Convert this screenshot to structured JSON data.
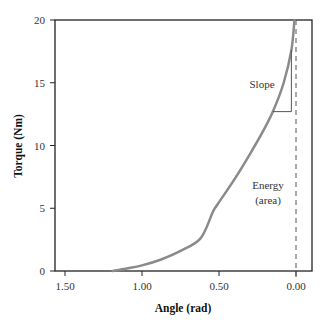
{
  "chart_data": {
    "type": "line",
    "title": "",
    "xlabel": "Angle (rad)",
    "ylabel": "Torque (Nm)",
    "xlim": [
      1.63,
      -0.1
    ],
    "ylim": [
      0,
      20
    ],
    "x_reversed": true,
    "grid": false,
    "legend": null,
    "x_ticks": [
      1.5,
      1.0,
      0.5,
      0.0
    ],
    "x_tick_labels": [
      "1.50",
      "1.00",
      "0.50",
      "0.00"
    ],
    "y_ticks": [
      0,
      5,
      10,
      15,
      20
    ],
    "y_tick_labels": [
      "0",
      "5",
      "10",
      "15",
      "20"
    ],
    "series": [
      {
        "name": "Torque-angle curve",
        "color": "#8a8a8a",
        "x": [
          1.19,
          1.1,
          1.0,
          0.88,
          0.75,
          0.62,
          0.54,
          0.51,
          0.4,
          0.3,
          0.22,
          0.15,
          0.08,
          0.03,
          0.01
        ],
        "y": [
          0.0,
          0.2,
          0.45,
          0.9,
          1.6,
          2.6,
          4.7,
          5.3,
          7.3,
          9.3,
          11.0,
          12.7,
          15.0,
          17.6,
          20.0
        ]
      }
    ],
    "reference_lines": [
      {
        "type": "vertical",
        "x": 0.0,
        "style": "dashed",
        "color": "#555555"
      }
    ],
    "annotations": [
      {
        "text": "Slope",
        "x": 0.21,
        "y": 15.3
      },
      {
        "text": "Energy",
        "x": 0.16,
        "y": 6.5
      },
      {
        "text": "(area)",
        "x": 0.16,
        "y": 5.3
      }
    ],
    "slope_triangle": {
      "x_from": 0.15,
      "x_to": 0.03,
      "y_from": 12.7,
      "y_to": 17.6
    }
  },
  "labels": {
    "xlabel": "Angle (rad)",
    "ylabel": "Torque (Nm)",
    "slope": "Slope",
    "energy_line1": "Energy",
    "energy_line2": "(area)"
  },
  "colors": {
    "curve": "#8a8a8a",
    "axes": "#222222",
    "dashed": "#555555"
  }
}
